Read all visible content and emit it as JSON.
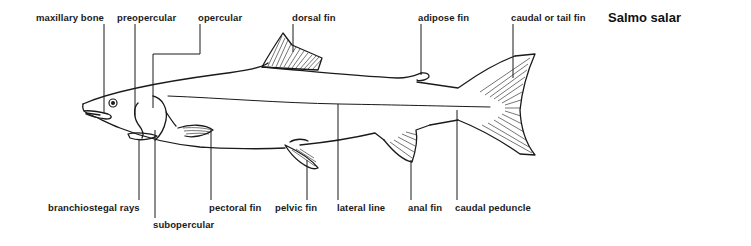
{
  "title": "Salmo salar",
  "labels": {
    "maxillary_bone": "maxillary bone",
    "preopercular": "preopercular",
    "opercular": "opercular",
    "dorsal_fin": "dorsal fin",
    "adipose_fin": "adipose fin",
    "caudal_fin": "caudal or tail fin",
    "branchiostegal_rays": "branchiostegal rays",
    "subopercular": "subopercular",
    "pectoral_fin": "pectoral fin",
    "pelvic_fin": "pelvic fin",
    "lateral_line": "lateral line",
    "anal_fin": "anal fin",
    "caudal_peduncle": "caudal peduncle"
  },
  "colors": {
    "ink": "#1a1a1a",
    "background": "#ffffff"
  }
}
